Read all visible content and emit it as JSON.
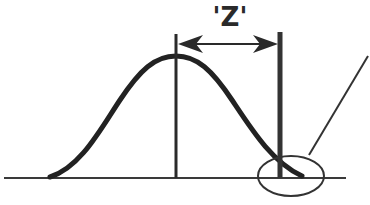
{
  "diagram": {
    "type": "normal-distribution-z-score",
    "distance_label": "'Z'",
    "elements": {
      "bell_curve": "normal distribution curve",
      "mean_line": "vertical line at mean (peak)",
      "threshold_line": "thick vertical line at Z distance from mean",
      "double_arrow": "horizontal arrow spanning mean to threshold",
      "baseline": "horizontal x-axis",
      "tail_callout": "ellipse circling right tail with leader line"
    },
    "colors": {
      "stroke": "#2a2a2a",
      "background": "#ffffff"
    }
  }
}
